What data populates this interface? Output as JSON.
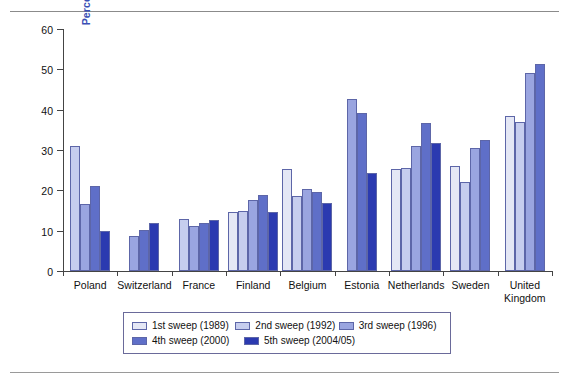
{
  "chart": {
    "type": "bar",
    "title": "",
    "xlabel": "",
    "ylabel": "Percentage favoring imprisonment",
    "ylim": [
      0,
      60
    ],
    "yticks": [
      0,
      10,
      20,
      30,
      40,
      50,
      60
    ],
    "grid": false,
    "legend_position": "bottom",
    "categories": [
      "Poland",
      "Switzerland",
      "France",
      "Finland",
      "Belgium",
      "Estonia",
      "Netherlands",
      "Sweden",
      "United\nKingdom"
    ],
    "series": [
      {
        "name": "1st sweep (1989)",
        "color": "#e4e7f5",
        "values": [
          null,
          null,
          null,
          14.7,
          25.3,
          null,
          25.3,
          26.0,
          38.5
        ]
      },
      {
        "name": "2nd sweep (1992)",
        "color": "#c6cdee",
        "values": [
          31.1,
          null,
          12.8,
          14.8,
          18.6,
          null,
          25.5,
          22.0,
          37.0
        ]
      },
      {
        "name": "3rd sweep (1996)",
        "color": "#9aa5e0",
        "values": [
          16.6,
          8.8,
          11.1,
          17.7,
          20.4,
          42.6,
          31.0,
          30.4,
          49.0
        ]
      },
      {
        "name": "4th sweep (2000)",
        "color": "#5f6fc8",
        "values": [
          21.2,
          10.1,
          12.0,
          18.8,
          19.7,
          39.2,
          36.8,
          32.4,
          51.3
        ]
      },
      {
        "name": "5th sweep (2004/05)",
        "color": "#2b3ab0",
        "values": [
          10.0,
          11.9,
          12.7,
          14.7,
          16.8,
          24.4,
          31.8,
          null,
          null
        ]
      }
    ]
  }
}
